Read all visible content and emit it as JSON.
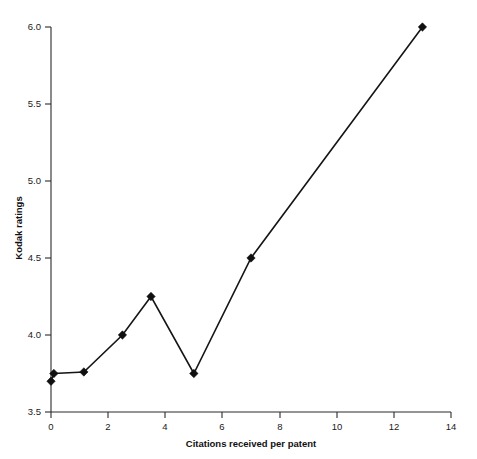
{
  "chart_data": {
    "type": "line",
    "title": "",
    "xlabel": "Citations received per patent",
    "ylabel": "Kodak ratings",
    "xlim": [
      0,
      14
    ],
    "ylim": [
      3.5,
      6.0
    ],
    "xticks": [
      0,
      2,
      4,
      6,
      8,
      10,
      12,
      14
    ],
    "xtick_labels": [
      "0",
      "2",
      "4",
      "6",
      "8",
      "10",
      "12",
      "14"
    ],
    "yticks": [
      3.5,
      4.0,
      4.5,
      5.0,
      5.5,
      6.0
    ],
    "ytick_labels": [
      "3.5",
      "4.0",
      "4.5",
      "5.0",
      "5.5",
      "6.0"
    ],
    "grid": false,
    "legend": false,
    "marker": "diamond",
    "line_color": "#151515",
    "marker_color": "#101010",
    "series": [
      {
        "name": "Kodak ratings",
        "x": [
          0,
          0.1,
          1.15,
          2.5,
          3.5,
          5.0,
          7.0,
          13.0
        ],
        "y": [
          3.7,
          3.75,
          3.76,
          4.0,
          4.25,
          3.75,
          4.5,
          6.0
        ]
      }
    ]
  },
  "labels": {
    "x_axis_title": "Citations received per patent",
    "y_axis_title": "Kodak ratings"
  }
}
